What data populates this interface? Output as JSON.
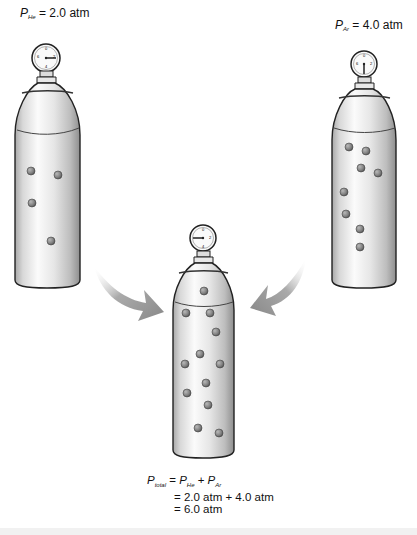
{
  "left_tank": {
    "gas": "He",
    "pressure_label": {
      "symbol": "P",
      "subscript": "He",
      "text": " = 2.0 atm"
    },
    "gauge_reading": "2",
    "particle_count": 4,
    "particles": [
      [
        31,
        171
      ],
      [
        58,
        175
      ],
      [
        32,
        203
      ],
      [
        51,
        241
      ]
    ]
  },
  "right_tank": {
    "gas": "Ar",
    "pressure_label": {
      "symbol": "P",
      "subscript": "Ar",
      "text": " = 4.0 atm"
    },
    "gauge_reading": "4",
    "particle_count": 8,
    "particles": [
      [
        349,
        147
      ],
      [
        366,
        151
      ],
      [
        361,
        168
      ],
      [
        378,
        173
      ],
      [
        344,
        192
      ],
      [
        346,
        214
      ],
      [
        360,
        229
      ],
      [
        360,
        247
      ]
    ]
  },
  "combined_tank": {
    "pressure_label": "Total pressure",
    "gauge_reading": "6",
    "particle_count": 12,
    "particles": [
      [
        204,
        291
      ],
      [
        186,
        313
      ],
      [
        210,
        313
      ],
      [
        216,
        332
      ],
      [
        200,
        354
      ],
      [
        185,
        364
      ],
      [
        220,
        364
      ],
      [
        206,
        383
      ],
      [
        187,
        393
      ],
      [
        208,
        405
      ],
      [
        198,
        428
      ],
      [
        219,
        433
      ]
    ]
  },
  "arrows": [
    {
      "from": "left_tank",
      "to": "combined_tank",
      "color": "#8c8c8c"
    },
    {
      "from": "right_tank",
      "to": "combined_tank",
      "color": "#8c8c8c"
    }
  ],
  "equation": {
    "line1": {
      "lhs_symbol": "P",
      "lhs_sub": "total",
      "eq": " = ",
      "t1_symbol": "P",
      "t1_sub": "He",
      "plus": " + ",
      "t2_symbol": "P",
      "t2_sub": "Ar"
    },
    "line2": "= 2.0 atm + 4.0 atm",
    "line3": "= 6.0 atm"
  },
  "colors": {
    "tank_light": "#f4f4f4",
    "tank_mid": "#d6d6d6",
    "tank_dark": "#9a9a9a",
    "outline": "#2a2a2a",
    "particle": "#8a8a8a",
    "arrow": "#8c8c8c"
  }
}
